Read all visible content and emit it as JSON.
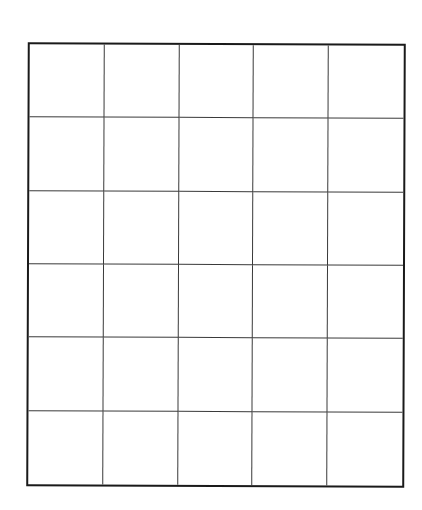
{
  "grid": {
    "columns": 5,
    "rows": 6,
    "cells_filled": false,
    "line_color": "#3a3a3a",
    "border_color": "#1a1a1a"
  }
}
